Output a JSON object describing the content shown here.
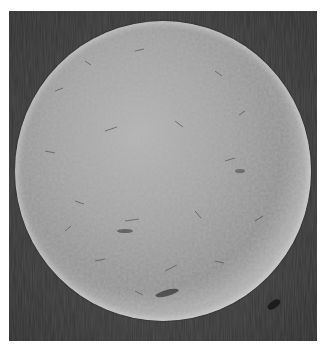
{
  "image": {
    "description": "Grayscale scanning electron micrograph of a single spherical particle with a textured surface on a dark background",
    "colors": {
      "background": "#ffffff",
      "frame_dark": "#3a3a3a",
      "sphere_light": "#b4b4b4",
      "sphere_mid": "#8f8f8f",
      "rim_highlight": "#c8c8c8"
    }
  }
}
